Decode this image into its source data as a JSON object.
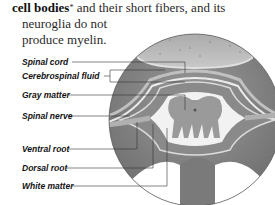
{
  "intro_text": {
    "bold": "cell bodies",
    "asterisk": "*",
    "line1_rest": " and their short fibers, and its",
    "line2": "neuroglia do not",
    "line3": "produce myelin."
  },
  "labels": [
    {
      "id": "spinal-cord",
      "text": "Spinal cord"
    },
    {
      "id": "cerebrospinal-fluid",
      "text": "Cerebrospinal fluid"
    },
    {
      "id": "gray-matter",
      "text": "Gray matter"
    },
    {
      "id": "spinal-nerve",
      "text": "Spinal nerve"
    },
    {
      "id": "ventral-root",
      "text": "Ventral root"
    },
    {
      "id": "dorsal-root",
      "text": "Dorsal root"
    },
    {
      "id": "white-matter",
      "text": "White matter"
    }
  ]
}
